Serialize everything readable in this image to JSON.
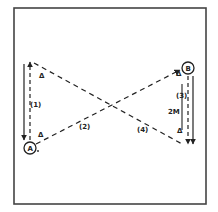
{
  "diagram": {
    "type": "drill-diagram",
    "stroke_color": "#222222",
    "border_color": "#444444",
    "players": {
      "A": {
        "label": "A"
      },
      "B": {
        "label": "B"
      }
    },
    "path_labels": {
      "p1": "(1)",
      "p2": "(2)",
      "p3": "(3)",
      "p4": "(4)"
    },
    "distance_label": "2M",
    "cones": [
      {
        "name": "cone-top-left",
        "glyph": "Δ"
      },
      {
        "name": "cone-bottom-left",
        "glyph": "Δ"
      },
      {
        "name": "cone-top-right",
        "glyph": "Δ"
      },
      {
        "name": "cone-bottom-right",
        "glyph": "Δ"
      }
    ]
  }
}
